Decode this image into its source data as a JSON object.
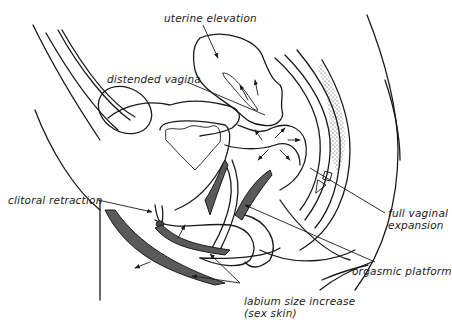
{
  "diagram": {
    "labels": {
      "uterine_elevation": "uterine elevation",
      "distended_vagina": "distended vagina",
      "clitoral_retraction": "clitoral retraction",
      "full_vaginal_expansion_line1": "full vaginal",
      "full_vaginal_expansion_line2": "expansion",
      "orgasmic_platform": "orgasmic platform",
      "labium_line1": "labium size increase",
      "labium_line2": "(sex skin)"
    },
    "colors": {
      "line": "#1a1a1a",
      "shading": "#5a5a5a",
      "background": "#ffffff"
    }
  }
}
